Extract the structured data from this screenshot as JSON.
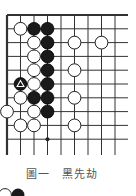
{
  "diagram": {
    "title": "圖一　黑先劫",
    "grid": {
      "origin_x": 7,
      "origin_y": 15,
      "spacing_x": 13.5,
      "spacing_y": 13.8,
      "cols": 9,
      "rows": 10,
      "line_end_x": 128,
      "line_end_y": 155,
      "line_color": "#333333",
      "edges": [
        "top",
        "left"
      ]
    },
    "star_points": [
      {
        "col": 3,
        "row": 9
      }
    ],
    "stones": [
      {
        "color": "white",
        "col": 1,
        "row": 1
      },
      {
        "color": "black",
        "col": 2,
        "row": 1
      },
      {
        "color": "black",
        "col": 3,
        "row": 1
      },
      {
        "color": "white",
        "col": 2,
        "row": 2
      },
      {
        "color": "black",
        "col": 3,
        "row": 2
      },
      {
        "color": "white",
        "col": 5,
        "row": 2
      },
      {
        "color": "white",
        "col": 7,
        "row": 2
      },
      {
        "color": "white",
        "col": 2,
        "row": 3
      },
      {
        "color": "black",
        "col": 3,
        "row": 3
      },
      {
        "color": "white",
        "col": 2,
        "row": 4
      },
      {
        "color": "black",
        "col": 3,
        "row": 4
      },
      {
        "color": "white",
        "col": 5,
        "row": 4
      },
      {
        "color": "black",
        "col": 1,
        "row": 5,
        "marker": "triangle"
      },
      {
        "color": "white",
        "col": 2,
        "row": 5
      },
      {
        "color": "black",
        "col": 3,
        "row": 5
      },
      {
        "color": "white",
        "col": 1,
        "row": 6
      },
      {
        "color": "black",
        "col": 2,
        "row": 6
      },
      {
        "color": "black",
        "col": 3,
        "row": 6
      },
      {
        "color": "white",
        "col": 5,
        "row": 6
      },
      {
        "color": "white",
        "col": 0,
        "row": 7
      },
      {
        "color": "white",
        "col": 2,
        "row": 7
      },
      {
        "color": "black",
        "col": 3,
        "row": 7
      },
      {
        "color": "white",
        "col": 1,
        "row": 8
      },
      {
        "color": "white",
        "col": 2,
        "row": 8
      },
      {
        "color": "white",
        "col": 5,
        "row": 8
      }
    ],
    "cropped_stones_bottom": [
      {
        "color": "white",
        "x": 5,
        "y": 195
      },
      {
        "color": "black",
        "x": 18,
        "y": 195
      }
    ]
  }
}
